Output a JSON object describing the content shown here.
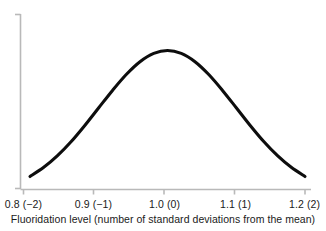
{
  "chart_data": {
    "type": "line",
    "title": "",
    "subtitle": "",
    "xlabel": "Fluoridation level (number of standard deviations from the mean)",
    "ylabel": "",
    "grid": false,
    "legend": null,
    "xlim": [
      0.77,
      1.23
    ],
    "ylim": [
      0,
      1.05
    ],
    "x_tick_labels": [
      "0.8 (−2)",
      "0.9 (−1)",
      "1.0 (0)",
      "1.1 (1)",
      "1.2 (2)"
    ],
    "x_tick_values": [
      0.8,
      0.9,
      1.0,
      1.1,
      1.2
    ],
    "x_tick_sd_values": [
      -2,
      -1,
      0,
      1,
      2
    ],
    "y_tick_labels": [],
    "series": [
      {
        "name": "Normal distribution of fluoridation level",
        "color": "#0d0d0d",
        "x": [
          0.8,
          0.82,
          0.84,
          0.86,
          0.88,
          0.9,
          0.92,
          0.94,
          0.96,
          0.98,
          1.0,
          1.02,
          1.04,
          1.06,
          1.08,
          1.1,
          1.12,
          1.14,
          1.16,
          1.18,
          1.2
        ],
        "y": [
          0.135,
          0.198,
          0.278,
          0.375,
          0.487,
          0.607,
          0.726,
          0.835,
          0.923,
          0.98,
          1.0,
          0.98,
          0.923,
          0.835,
          0.726,
          0.607,
          0.487,
          0.375,
          0.278,
          0.198,
          0.135
        ]
      }
    ],
    "annotations": []
  },
  "axis": {
    "line_color": "#b9b9b9",
    "tick_color": "#b9b9b9"
  },
  "caption": {
    "text": "Fluoridation level (number of standard deviations from the mean)"
  },
  "ticks": [
    {
      "label": "0.8 (−2)",
      "x": 23
    },
    {
      "label": "0.9 (−1)",
      "x": 93
    },
    {
      "label": "1.0 (0)",
      "x": 164
    },
    {
      "label": "1.1 (1)",
      "x": 235
    },
    {
      "label": "1.2 (2)",
      "x": 305
    }
  ]
}
